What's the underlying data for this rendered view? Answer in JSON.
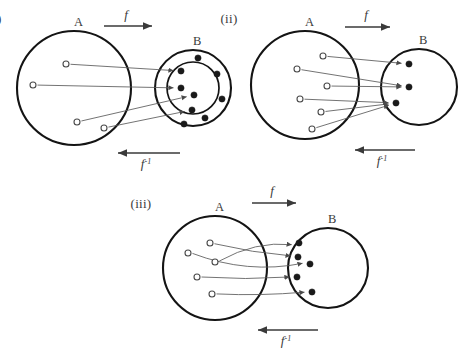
{
  "figure": {
    "caption_labels": [
      "(i)",
      "(ii)",
      "(iii)"
    ],
    "set_source_label": "A",
    "set_target_label": "B",
    "forward_map_label": "f",
    "inverse_map_label": "f",
    "inverse_map_superscript": "-1",
    "background_color": "#ffffff",
    "ink_color": "#141414",
    "line_color": "#5a5a5a"
  },
  "panels": [
    {
      "id": "panel-i",
      "roman": "(i)",
      "source": {
        "label": "A",
        "cx": 74,
        "cy": 88,
        "r": 57,
        "points": [
          {
            "x": 66,
            "y": 64
          },
          {
            "x": 33,
            "y": 85
          },
          {
            "x": 77,
            "y": 122
          },
          {
            "x": 104,
            "y": 128
          }
        ]
      },
      "target": {
        "label": "B",
        "cx": 193,
        "cy": 88,
        "r": 38,
        "inner_r": 26,
        "inner_points": [
          {
            "x": 181,
            "y": 71
          },
          {
            "x": 181,
            "y": 88
          },
          {
            "x": 194,
            "y": 95
          },
          {
            "x": 192,
            "y": 110
          }
        ],
        "outer_points": [
          {
            "x": 198,
            "y": 58
          },
          {
            "x": 217,
            "y": 74
          },
          {
            "x": 222,
            "y": 99
          },
          {
            "x": 205,
            "y": 118
          },
          {
            "x": 184,
            "y": 124
          }
        ]
      },
      "mappings": [
        {
          "from": 0,
          "to": 0
        },
        {
          "from": 1,
          "to": 1
        },
        {
          "from": 2,
          "to": 2
        },
        {
          "from": 3,
          "to": 3
        }
      ],
      "forward_arrow": {
        "x1": 104,
        "y1": 26,
        "x2": 152,
        "y2": 26,
        "label_x": 126,
        "label_y": 19
      },
      "inverse_arrow": {
        "x1": 180,
        "y1": 153,
        "x2": 118,
        "y2": 153,
        "label_x": 146,
        "label_y": 168
      }
    },
    {
      "id": "panel-ii",
      "roman": "(ii)",
      "source": {
        "label": "A",
        "cx": 305,
        "cy": 85,
        "r": 54,
        "points": [
          {
            "x": 323,
            "y": 56
          },
          {
            "x": 297,
            "y": 69
          },
          {
            "x": 327,
            "y": 86
          },
          {
            "x": 300,
            "y": 99
          },
          {
            "x": 321,
            "y": 112
          },
          {
            "x": 312,
            "y": 129
          }
        ]
      },
      "target": {
        "label": "B",
        "cx": 419,
        "cy": 87,
        "r": 38,
        "points": [
          {
            "x": 409,
            "y": 64
          },
          {
            "x": 409,
            "y": 87
          },
          {
            "x": 396,
            "y": 103
          }
        ]
      },
      "mappings": [
        {
          "from": 0,
          "to": 0
        },
        {
          "from": 1,
          "to": 1
        },
        {
          "from": 2,
          "to": 1
        },
        {
          "from": 3,
          "to": 2
        },
        {
          "from": 4,
          "to": 2
        },
        {
          "from": 5,
          "to": 2
        }
      ],
      "forward_arrow": {
        "x1": 345,
        "y1": 27,
        "x2": 390,
        "y2": 27,
        "label_x": 366,
        "label_y": 19
      },
      "inverse_arrow": {
        "x1": 415,
        "y1": 150,
        "x2": 355,
        "y2": 150,
        "label_x": 382,
        "label_y": 165
      }
    },
    {
      "id": "panel-iii",
      "roman": "(iii)",
      "source": {
        "label": "A",
        "cx": 215,
        "cy": 268,
        "r": 52,
        "points": [
          {
            "x": 210,
            "y": 243
          },
          {
            "x": 188,
            "y": 253
          },
          {
            "x": 215,
            "y": 262
          },
          {
            "x": 197,
            "y": 277
          },
          {
            "x": 212,
            "y": 294
          }
        ]
      },
      "target": {
        "label": "B",
        "cx": 328,
        "cy": 268,
        "r": 40,
        "points": [
          {
            "x": 299,
            "y": 243
          },
          {
            "x": 298,
            "y": 257
          },
          {
            "x": 310,
            "y": 264
          },
          {
            "x": 297,
            "y": 277
          },
          {
            "x": 312,
            "y": 292
          }
        ]
      },
      "mappings": [
        {
          "from": 0,
          "to": 1
        },
        {
          "from": 1,
          "to": 2
        },
        {
          "from": 2,
          "to": 0
        },
        {
          "from": 3,
          "to": 3
        },
        {
          "from": 4,
          "to": 4
        }
      ],
      "forward_arrow": {
        "x1": 252,
        "y1": 203,
        "x2": 296,
        "y2": 203,
        "label_x": 272,
        "label_y": 195
      },
      "inverse_arrow": {
        "x1": 318,
        "y1": 330,
        "x2": 258,
        "y2": 330,
        "label_x": 286,
        "label_y": 345
      }
    }
  ]
}
